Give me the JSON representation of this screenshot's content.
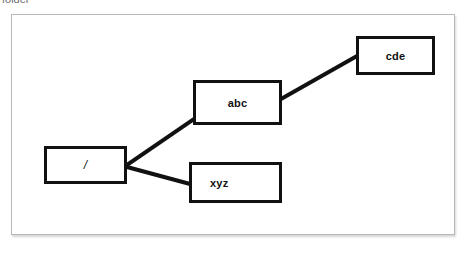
{
  "caption": {
    "text": "folder"
  },
  "diagram": {
    "background": "#ffffff",
    "border_color": "#b9b9b9",
    "node_border_color": "#111111",
    "edge_color": "#111111",
    "nodes": [
      {
        "id": "root",
        "label": "/",
        "x": 32,
        "y": 131,
        "width": 83,
        "height": 38
      },
      {
        "id": "abc",
        "label": "abc",
        "x": 181,
        "y": 65,
        "width": 89,
        "height": 45
      },
      {
        "id": "cde",
        "label": "cde",
        "x": 344,
        "y": 21,
        "width": 79,
        "height": 39
      },
      {
        "id": "xyz",
        "label": "xyz",
        "x": 177,
        "y": 147,
        "width": 93,
        "height": 41
      }
    ],
    "edges": [
      {
        "id": "root-abc",
        "from": "root",
        "to": "abc",
        "x1": 115,
        "y1": 150,
        "x2": 182,
        "y2": 104
      },
      {
        "id": "root-xyz",
        "from": "root",
        "to": "xyz",
        "x1": 115,
        "y1": 152,
        "x2": 178,
        "y2": 169
      },
      {
        "id": "abc-cde",
        "from": "abc",
        "to": "cde",
        "x1": 269,
        "y1": 84,
        "x2": 345,
        "y2": 41
      }
    ]
  }
}
